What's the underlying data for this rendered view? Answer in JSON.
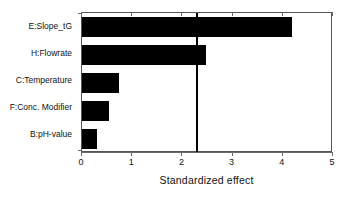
{
  "chart_data": {
    "type": "bar",
    "orientation": "horizontal",
    "title": "",
    "xlabel": "Standardized effect",
    "ylabel": "",
    "categories": [
      "E:Slope_tG",
      "H:Flowrate",
      "C:Temperature",
      "F:Conc. Modifier",
      "B:pH-value"
    ],
    "values": [
      4.18,
      2.48,
      0.74,
      0.54,
      0.3
    ],
    "xlim": [
      0,
      5
    ],
    "xticks": [
      0,
      1,
      2,
      3,
      4,
      5
    ],
    "xtick_labels": [
      "0",
      "1",
      "2",
      "3",
      "4",
      "5"
    ],
    "grid": false,
    "legend": null,
    "annotations": [
      {
        "name": "significance-threshold",
        "type": "vertical-line",
        "value": 2.3
      }
    ],
    "bar_color": "#000000",
    "axis_color": "#555555",
    "background_color": "#ffffff"
  },
  "axis": {
    "x_title": "Standardized effect"
  }
}
